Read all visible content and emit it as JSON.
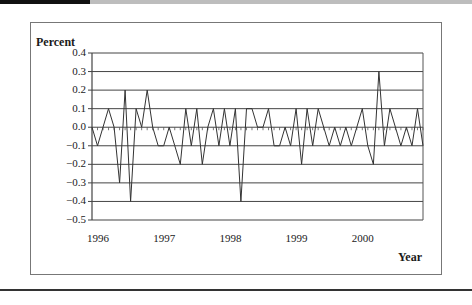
{
  "chart_data": {
    "type": "line",
    "title": "",
    "ylabel": "Percent",
    "xlabel": "Year",
    "ylim": [
      -0.5,
      0.4
    ],
    "yticks": [
      "0.4",
      "0.3",
      "0.2",
      "0.1",
      "0.0",
      "-0.1",
      "-0.2",
      "-0.3",
      "-0.4",
      "-0.5"
    ],
    "xticks": [
      "1996",
      "1997",
      "1998",
      "1999",
      "2000"
    ],
    "grid": true,
    "legend": null,
    "frequency": "monthly",
    "x_start": "1996-01",
    "series": [
      {
        "name": "Percent",
        "values": [
          0.0,
          -0.1,
          0.0,
          0.1,
          0.0,
          -0.3,
          0.2,
          -0.4,
          0.1,
          0.0,
          0.2,
          0.0,
          -0.1,
          -0.1,
          0.0,
          -0.1,
          -0.2,
          0.1,
          -0.1,
          0.1,
          -0.2,
          0.0,
          0.1,
          -0.1,
          0.1,
          -0.1,
          0.1,
          -0.4,
          0.1,
          0.1,
          0.0,
          0.0,
          0.1,
          -0.1,
          -0.1,
          0.0,
          -0.1,
          0.1,
          -0.2,
          0.1,
          -0.1,
          0.1,
          0.0,
          -0.1,
          0.0,
          -0.1,
          0.0,
          -0.1,
          0.0,
          0.1,
          -0.1,
          -0.2,
          0.3,
          -0.1,
          0.1,
          0.0,
          -0.1,
          0.0,
          -0.1,
          0.1,
          -0.1
        ]
      }
    ]
  },
  "axis": {
    "ylabel": "Percent",
    "xlabel": "Year"
  },
  "colors": {
    "line": "#333333",
    "grid": "#444444",
    "frame": "#777777"
  }
}
